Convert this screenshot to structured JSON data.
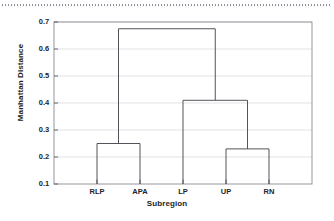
{
  "chart_data": {
    "type": "line",
    "chart_kind": "dendrogram",
    "title": "",
    "xlabel": "Subregion",
    "ylabel": "Manhattan Distance",
    "ylim": [
      0.1,
      0.7
    ],
    "ytick_labels": [
      "0.7",
      "0.6",
      "0.5",
      "0.4",
      "0.3",
      "0.2",
      "0.1"
    ],
    "ytick_values": [
      0.7,
      0.6,
      0.5,
      0.4,
      0.3,
      0.2,
      0.1
    ],
    "grid": true,
    "legend": "none",
    "leaves": [
      "RLP",
      "APA",
      "LP",
      "UP",
      "RN"
    ],
    "leaf_positions": [
      1,
      2,
      3,
      4,
      5
    ],
    "merges": [
      {
        "id": "m1",
        "label": "RLP + APA",
        "members": [
          "RLP",
          "APA"
        ],
        "height": 0.25,
        "left": "RLP",
        "right": "APA"
      },
      {
        "id": "m2",
        "label": "UP + RN",
        "members": [
          "UP",
          "RN"
        ],
        "height": 0.23,
        "left": "UP",
        "right": "RN"
      },
      {
        "id": "m3",
        "label": "LP + (UP, RN)",
        "members": [
          "LP",
          "UP",
          "RN"
        ],
        "height": 0.41,
        "left": "LP",
        "right": "m2"
      },
      {
        "id": "m4",
        "label": "(RLP, APA) + (LP, UP, RN)",
        "members": [
          "RLP",
          "APA",
          "LP",
          "UP",
          "RN"
        ],
        "height": 0.675,
        "left": "m1",
        "right": "m3"
      }
    ],
    "colors": {
      "tree_line": "#4a4a52",
      "gridline": "#d5d5da",
      "axis": "#8c8c94",
      "text": "#1d1d24",
      "background": "#ffffff"
    }
  },
  "axes": {
    "x_title": "Subregion",
    "y_title": "Manhattan Distance",
    "x_labels": [
      "RLP",
      "APA",
      "LP",
      "UP",
      "RN"
    ],
    "y_labels": [
      "0.7",
      "0.6",
      "0.5",
      "0.4",
      "0.3",
      "0.2",
      "0.1"
    ]
  },
  "figure": {
    "artifact": "scan-line-dotted"
  }
}
